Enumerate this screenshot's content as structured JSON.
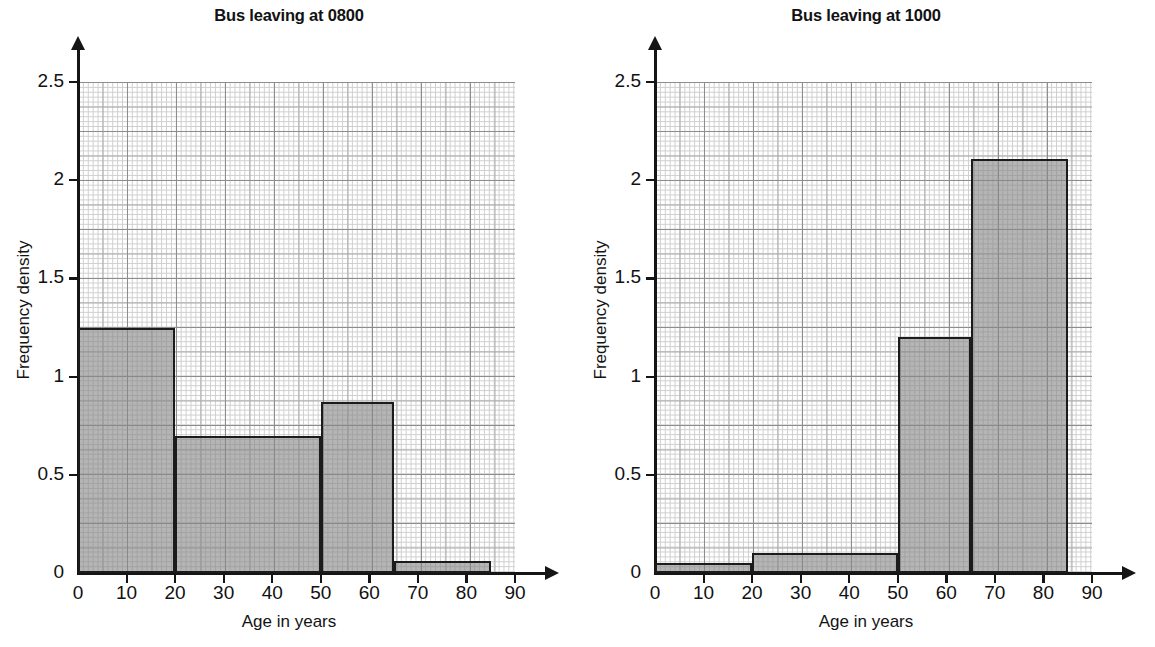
{
  "chart_data": [
    {
      "type": "bar",
      "title": "Bus leaving at 0800",
      "xlabel": "Age in years",
      "ylabel": "Frequency density",
      "xlim": [
        0,
        90
      ],
      "ylim": [
        0,
        2.5
      ],
      "grid": true,
      "legend": "none",
      "xticks": [
        "0",
        "10",
        "20",
        "30",
        "40",
        "50",
        "60",
        "70",
        "80",
        "90"
      ],
      "xtick_values": [
        0,
        10,
        20,
        30,
        40,
        50,
        60,
        70,
        80,
        90
      ],
      "yticks": [
        "0",
        "0.5",
        "1",
        "1.5",
        "2",
        "2.5"
      ],
      "ytick_values": [
        0,
        0.5,
        1,
        1.5,
        2,
        2.5
      ],
      "bins": [
        {
          "start": 0,
          "end": 20,
          "density": 1.25
        },
        {
          "start": 20,
          "end": 50,
          "density": 0.7
        },
        {
          "start": 50,
          "end": 65,
          "density": 0.87
        },
        {
          "start": 65,
          "end": 85,
          "density": 0.06
        }
      ]
    },
    {
      "type": "bar",
      "title": "Bus leaving at 1000",
      "xlabel": "Age in years",
      "ylabel": "Frequency density",
      "xlim": [
        0,
        90
      ],
      "ylim": [
        0,
        2.5
      ],
      "grid": true,
      "legend": "none",
      "xticks": [
        "0",
        "10",
        "20",
        "30",
        "40",
        "50",
        "60",
        "70",
        "80",
        "90"
      ],
      "xtick_values": [
        0,
        10,
        20,
        30,
        40,
        50,
        60,
        70,
        80,
        90
      ],
      "yticks": [
        "0",
        "0.5",
        "1",
        "1.5",
        "2",
        "2.5"
      ],
      "ytick_values": [
        0,
        0.5,
        1,
        1.5,
        2,
        2.5
      ],
      "bins": [
        {
          "start": 0,
          "end": 20,
          "density": 0.05
        },
        {
          "start": 20,
          "end": 50,
          "density": 0.1
        },
        {
          "start": 50,
          "end": 65,
          "density": 1.2
        },
        {
          "start": 65,
          "end": 85,
          "density": 2.11
        }
      ]
    }
  ],
  "style": {
    "bar_fill": "#888888",
    "bar_edge": "#1b1b1b",
    "axis_color": "#151515",
    "grid_major": "#8d8d8d",
    "grid_minor": "#cfcfcf",
    "background": "#ffffff"
  }
}
